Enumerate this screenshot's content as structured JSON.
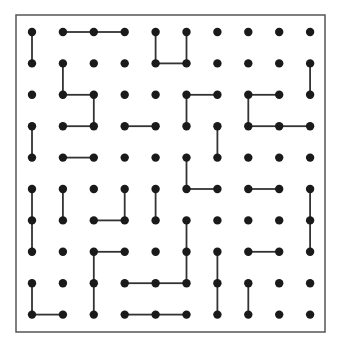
{
  "grid": {
    "cols": 10,
    "rows": 10,
    "x0": 32,
    "y0": 32,
    "dx": 30.9,
    "dy": 31.4,
    "dot_radius": 4.2,
    "dot_color": "#1a1a1a",
    "line_color": "#333333",
    "line_width": 1.8,
    "border": {
      "x": 16,
      "y": 15,
      "w": 309,
      "h": 317,
      "color": "#555555",
      "width": 1.5
    }
  },
  "segments": [
    [
      0,
      0,
      0,
      1
    ],
    [
      1,
      0,
      2,
      0
    ],
    [
      2,
      0,
      3,
      0
    ],
    [
      4,
      0,
      4,
      1
    ],
    [
      4,
      1,
      5,
      1
    ],
    [
      5,
      0,
      5,
      1
    ],
    [
      1,
      1,
      1,
      2
    ],
    [
      1,
      2,
      2,
      2
    ],
    [
      2,
      2,
      2,
      3
    ],
    [
      1,
      3,
      2,
      3
    ],
    [
      9,
      1,
      9,
      2
    ],
    [
      5,
      2,
      6,
      2
    ],
    [
      5,
      2,
      5,
      3
    ],
    [
      7,
      2,
      8,
      2
    ],
    [
      7,
      2,
      7,
      3
    ],
    [
      7,
      3,
      8,
      3
    ],
    [
      8,
      3,
      9,
      3
    ],
    [
      3,
      3,
      4,
      3
    ],
    [
      0,
      3,
      0,
      4
    ],
    [
      6,
      3,
      6,
      4
    ],
    [
      1,
      4,
      2,
      4
    ],
    [
      5,
      4,
      5,
      5
    ],
    [
      5,
      5,
      6,
      5
    ],
    [
      7,
      5,
      8,
      5
    ],
    [
      0,
      5,
      0,
      6
    ],
    [
      0,
      6,
      0,
      7
    ],
    [
      1,
      5,
      1,
      6
    ],
    [
      3,
      5,
      3,
      6
    ],
    [
      2,
      6,
      3,
      6
    ],
    [
      4,
      5,
      4,
      6
    ],
    [
      9,
      5,
      9,
      6
    ],
    [
      9,
      6,
      9,
      7
    ],
    [
      2,
      7,
      3,
      7
    ],
    [
      2,
      7,
      2,
      8
    ],
    [
      2,
      8,
      2,
      9
    ],
    [
      5,
      6,
      5,
      7
    ],
    [
      5,
      7,
      5,
      8
    ],
    [
      3,
      8,
      4,
      8
    ],
    [
      4,
      8,
      5,
      8
    ],
    [
      7,
      7,
      8,
      7
    ],
    [
      6,
      7,
      6,
      8
    ],
    [
      6,
      8,
      6,
      9
    ],
    [
      7,
      8,
      7,
      9
    ],
    [
      0,
      8,
      0,
      9
    ],
    [
      0,
      9,
      1,
      9
    ],
    [
      3,
      9,
      4,
      9
    ],
    [
      4,
      9,
      5,
      9
    ]
  ]
}
